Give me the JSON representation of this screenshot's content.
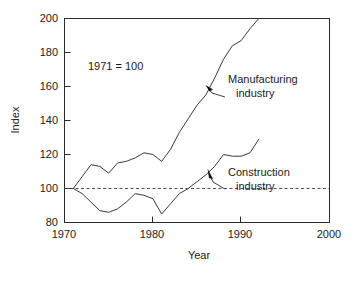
{
  "chart_data": {
    "type": "line",
    "title": "",
    "xlabel": "Year",
    "ylabel": "Index",
    "xlim": [
      1970,
      2000
    ],
    "ylim": [
      80,
      200
    ],
    "xticks": [
      1970,
      1980,
      1990,
      2000
    ],
    "yticks": [
      80,
      100,
      120,
      140,
      160,
      180,
      200
    ],
    "grid": false,
    "legend": "inline-annotations",
    "note": "1971 = 100",
    "baseline": {
      "label": "100",
      "value": 100,
      "style": "dashed",
      "color": "#4a4a8a"
    },
    "series": [
      {
        "name": "Manufacturing industry",
        "color": "#3a3a3a",
        "x": [
          1970,
          1971,
          1972,
          1973,
          1974,
          1975,
          1976,
          1977,
          1978,
          1979,
          1980,
          1981,
          1982,
          1983,
          1984,
          1985,
          1986,
          1987,
          1988,
          1989,
          1990,
          1991,
          1992
        ],
        "y": [
          100,
          100,
          107,
          114,
          113,
          109,
          115,
          116,
          118,
          121,
          120,
          116,
          123,
          133,
          141,
          149,
          155,
          165,
          176,
          184,
          187,
          194,
          200
        ]
      },
      {
        "name": "Construction industry",
        "color": "#3a3a3a",
        "x": [
          1970,
          1971,
          1972,
          1973,
          1974,
          1975,
          1976,
          1977,
          1978,
          1979,
          1980,
          1981,
          1982,
          1983,
          1984,
          1985,
          1986,
          1987,
          1988,
          1989,
          1990,
          1991,
          1992
        ],
        "y": [
          100,
          100,
          97,
          92,
          87,
          86,
          88,
          92,
          97,
          96,
          94,
          85,
          91,
          97,
          100,
          104,
          108,
          113,
          120,
          119,
          119,
          121,
          129
        ]
      }
    ],
    "annotations": [
      {
        "name": "manufacturing-annotation",
        "line1": "Manufacturing",
        "line2": "industry",
        "text_x": 228,
        "text_y": 80,
        "arrow_tip_x": 206,
        "arrow_tip_y": 86,
        "leader_from_x": 225,
        "leader_from_y": 97,
        "leader_to_x": 212,
        "leader_to_y": 93
      },
      {
        "name": "construction-annotation",
        "line1": "Construction",
        "line2": "industry",
        "text_x": 228,
        "text_y": 173,
        "arrow_tip_x": 210,
        "arrow_tip_y": 167,
        "leader_from_x": 225,
        "leader_from_y": 189,
        "leader_to_x": 212,
        "leader_to_y": 180
      }
    ]
  },
  "axes": {
    "y": {
      "title": "Index",
      "tick_labels": [
        "200",
        "180",
        "160",
        "140",
        "120",
        "100",
        "80"
      ]
    },
    "x": {
      "title": "Year",
      "tick_labels": [
        "1970",
        "1980",
        "1990",
        "2000"
      ]
    }
  },
  "note": {
    "text": "1971 = 100"
  },
  "labels": {
    "manufacturing_line1": "Manufacturing",
    "manufacturing_line2": "industry",
    "construction_line1": "Construction",
    "construction_line2": "industry"
  }
}
